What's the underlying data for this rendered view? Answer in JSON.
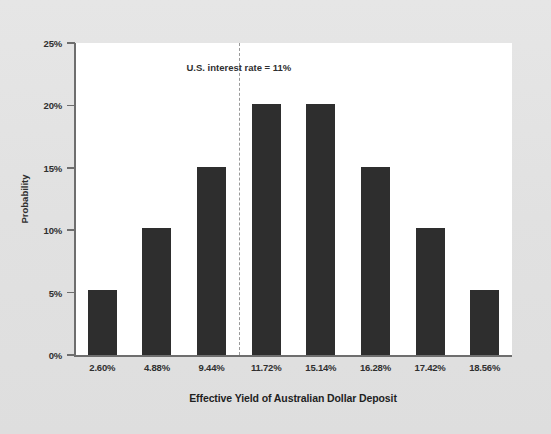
{
  "chart_data": {
    "type": "bar",
    "title": "",
    "xlabel": "Effective Yield of Australian Dollar Deposit",
    "ylabel": "Probability",
    "categories": [
      "2.60%",
      "4.88%",
      "9.44%",
      "11.72%",
      "15.14%",
      "16.28%",
      "17.42%",
      "18.56%"
    ],
    "values": [
      5.2,
      10.2,
      15.1,
      20.1,
      20.1,
      15.1,
      10.2,
      5.2
    ],
    "value_labels": [
      "5.2%",
      "10.2%",
      "15.1%",
      "20.1%",
      "20.1%",
      "15.1%",
      "10.2%",
      "5.2%"
    ],
    "ylim": [
      0,
      25
    ],
    "ytick_values": [
      0,
      5,
      10,
      15,
      20,
      25
    ],
    "ytick_labels": [
      "0%",
      "5%",
      "10%",
      "15%",
      "20%",
      "25%"
    ],
    "grid": false,
    "legend": "none",
    "bar_color": "#2e2e2e",
    "plot_background": "#ffffff",
    "figure_background": "#e3e3e3",
    "annotations": [
      {
        "text": "U.S. interest rate = 11%",
        "type": "vertical-reference-line",
        "line_style": "dashed",
        "line_color": "#9a9a9a",
        "x_position_between": [
          "9.44%",
          "11.72%"
        ],
        "value": 11
      }
    ]
  },
  "axis": {
    "y_title": "Probability",
    "x_title": "Effective Yield of Australian Dollar Deposit"
  }
}
